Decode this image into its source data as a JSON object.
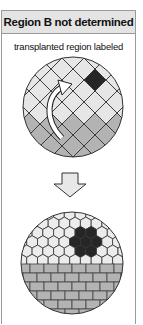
{
  "panel": {
    "title": "Region B not determined",
    "caption": "transplanted region labeled"
  },
  "diagram": {
    "top_circle": {
      "pattern": "diamond-grid",
      "upper_region_color": "#e6e6e6",
      "lower_region_color": "#b3b3b3",
      "labeled_cell_color": "#262626",
      "arrow": "curved-white-arrow"
    },
    "transition_arrow": "down-arrow",
    "bottom_circle": {
      "upper_pattern": "hexagon-grid",
      "lower_pattern": "brick-grid",
      "hex_color": "#ececec",
      "brick_color": "#b3b3b3",
      "labeled_cluster_color": "#262626"
    },
    "colors": {
      "outline": "#333333",
      "frame_border": "#9a9a9a",
      "header_bg": "#e4e4e4"
    }
  }
}
